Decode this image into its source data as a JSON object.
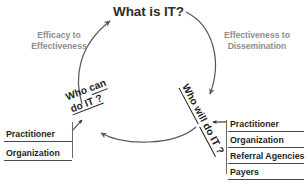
{
  "diagram": {
    "title_node": "What is IT?",
    "nodes": [
      {
        "id": "what-is-it",
        "label": "What is IT?"
      },
      {
        "id": "who-can-do-it",
        "line1": "Who can",
        "line2": "do IT ?"
      },
      {
        "id": "who-will-do-it",
        "line1": "Who will",
        "line2": "do IT ?"
      }
    ],
    "edge_labels": [
      {
        "id": "efficacy-to-effectiveness",
        "line1": "Efficacy to",
        "line2": "Effectiveness"
      },
      {
        "id": "effectiveness-to-dissemination",
        "line1": "Effectiveness to",
        "line2": "Dissemination"
      }
    ],
    "left_actors": {
      "items": [
        "Practitioner",
        "Organization"
      ]
    },
    "right_actors": {
      "items": [
        "Practitioner",
        "Organization",
        "Referral Agencies",
        "Payers"
      ]
    },
    "colors": {
      "background": "#ffffff",
      "node_text": "#1f1f1f",
      "title_text": "#2e2e2e",
      "edge_label_text": "#8d8d8d",
      "arc_stroke": "#5a5a5a",
      "rule_stroke": "#4a4a4a"
    },
    "arcs": [
      {
        "id": "arc-left-up",
        "from": "who-can-do-it",
        "to": "what-is-it",
        "direction": "up-right"
      },
      {
        "id": "arc-right-down",
        "from": "what-is-it",
        "to": "who-will-do-it",
        "direction": "down"
      },
      {
        "id": "arc-bottom-left",
        "from": "who-will-do-it",
        "to": "who-can-do-it",
        "direction": "left"
      },
      {
        "id": "arc-left-actors",
        "from": "left_actors",
        "to": "who-can-do-it",
        "direction": "up-right"
      },
      {
        "id": "arc-right-actors",
        "from": "right_actors",
        "to": "who-will-do-it",
        "direction": "left"
      }
    ]
  }
}
